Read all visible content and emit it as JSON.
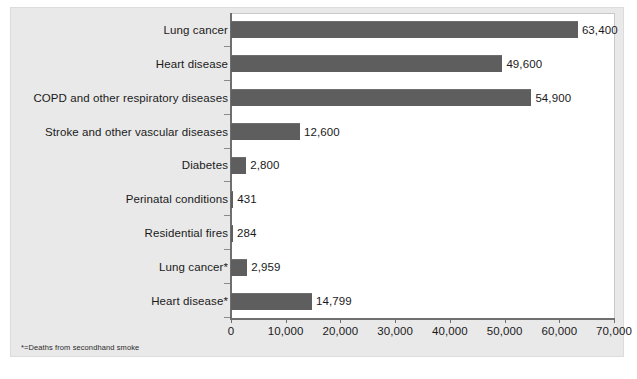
{
  "chart_data": {
    "type": "bar",
    "orientation": "horizontal",
    "title": "",
    "xlabel": "",
    "ylabel": "",
    "xlim": [
      0,
      70000
    ],
    "grid": false,
    "legend": null,
    "x_tick_labels": [
      "0",
      "10,000",
      "20,000",
      "30,000",
      "40,000",
      "50,000",
      "60,000",
      "70,000"
    ],
    "x_tick_values": [
      0,
      10000,
      20000,
      30000,
      40000,
      50000,
      60000,
      70000
    ],
    "categories": [
      "Lung cancer",
      "Heart disease",
      "COPD and other respiratory diseases",
      "Stroke and other vascular diseases",
      "Diabetes",
      "Perinatal conditions",
      "Residential fires",
      "Lung cancer*",
      "Heart disease*"
    ],
    "values": [
      63400,
      49600,
      54900,
      12600,
      2800,
      431,
      284,
      2959,
      14799
    ],
    "value_labels": [
      "63,400",
      "49,600",
      "54,900",
      "12,600",
      "2,800",
      "431",
      "284",
      "2,959",
      "14,799"
    ],
    "footnote": "*=Deaths from secondhand smoke",
    "colors": {
      "bar": "#5e5e5e",
      "panel_background": "#e9e9e9",
      "plot_background": "#ffffff",
      "axis": "#6f6f6f",
      "text": "#1a1a1a"
    }
  }
}
